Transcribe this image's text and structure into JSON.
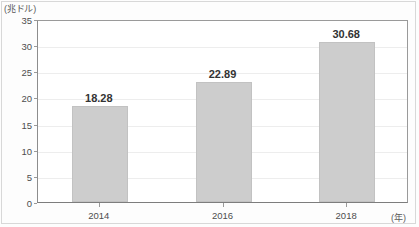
{
  "chart_data": {
    "type": "bar",
    "title": "",
    "subtitle": "",
    "categories": [
      "2014",
      "2016",
      "2018"
    ],
    "values": [
      18.28,
      22.89,
      30.68
    ],
    "value_labels": [
      "18.28",
      "22.89",
      "30.68"
    ],
    "series": [
      {
        "name": "",
        "values": [
          18.28,
          22.89,
          30.68
        ]
      }
    ],
    "xlabel": "(年)",
    "ylabel": "(兆ドル)",
    "ylim": [
      0,
      35
    ],
    "ytick_labels": [
      "0",
      "5",
      "10",
      "15",
      "20",
      "25",
      "30",
      "35"
    ],
    "ytick_values": [
      0,
      5,
      10,
      15,
      20,
      25,
      30,
      35
    ],
    "xtick_labels": [
      "2014",
      "2016",
      "2018"
    ],
    "grid": true,
    "grid_axis": "y",
    "legend": false,
    "legend_position": "none",
    "bar_color": "#cdcdcd",
    "bar_edge_color": "#c2c2c2",
    "axis_color": "#8d8d8d",
    "gridline_color": "#ededed",
    "text_color": "#333333",
    "value_label_position": "above"
  }
}
